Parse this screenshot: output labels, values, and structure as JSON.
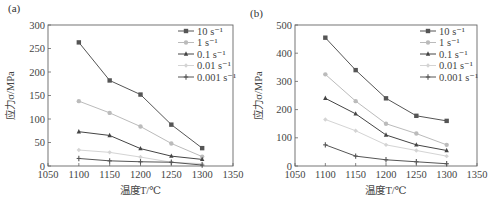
{
  "chart_data": [
    {
      "panel": "(a)",
      "type": "line",
      "title": "",
      "xlabel": "温度T/℃",
      "ylabel": "应力σ/MPa",
      "x": [
        1100,
        1150,
        1200,
        1250,
        1300
      ],
      "xlim": [
        1050,
        1350
      ],
      "ylim": [
        0,
        300
      ],
      "xticks": [
        1050,
        1100,
        1150,
        1200,
        1250,
        1300,
        1350
      ],
      "yticks": [
        0,
        50,
        100,
        150,
        200,
        250,
        300
      ],
      "grid": false,
      "legend_position": "upper right",
      "series": [
        {
          "name": "10 s⁻¹",
          "marker": "square",
          "color": "#555555",
          "values": [
            263,
            182,
            152,
            88,
            38
          ]
        },
        {
          "name": "1 s⁻¹",
          "marker": "circle",
          "color": "#bbbbbb",
          "values": [
            138,
            113,
            84,
            48,
            20
          ]
        },
        {
          "name": "0.1 s⁻¹",
          "marker": "triangle",
          "color": "#444444",
          "values": [
            73,
            65,
            37,
            21,
            14
          ]
        },
        {
          "name": "0.01 s⁻¹",
          "marker": "diamond",
          "color": "#d4d4d4",
          "values": [
            34,
            29,
            19,
            8,
            5
          ]
        },
        {
          "name": "0.001 s⁻¹",
          "marker": "star",
          "color": "#555555",
          "values": [
            16,
            11,
            9,
            8,
            2
          ]
        }
      ]
    },
    {
      "panel": "(b)",
      "type": "line",
      "title": "",
      "xlabel": "温度T/℃",
      "ylabel": "应力σ/MPa",
      "x": [
        1100,
        1150,
        1200,
        1250,
        1300
      ],
      "xlim": [
        1050,
        1350
      ],
      "ylim": [
        0,
        500
      ],
      "xticks": [
        1050,
        1100,
        1150,
        1200,
        1250,
        1300,
        1350
      ],
      "yticks": [
        0,
        100,
        200,
        300,
        400,
        500
      ],
      "grid": false,
      "legend_position": "upper right",
      "series": [
        {
          "name": "10 s⁻¹",
          "marker": "square",
          "color": "#555555",
          "values": [
            455,
            340,
            240,
            178,
            160
          ]
        },
        {
          "name": "1 s⁻¹",
          "marker": "circle",
          "color": "#bbbbbb",
          "values": [
            325,
            230,
            150,
            115,
            75
          ]
        },
        {
          "name": "0.1 s⁻¹",
          "marker": "triangle",
          "color": "#444444",
          "values": [
            240,
            185,
            110,
            75,
            55
          ]
        },
        {
          "name": "0.01 s⁻¹",
          "marker": "diamond",
          "color": "#d4d4d4",
          "values": [
            165,
            125,
            75,
            55,
            35
          ]
        },
        {
          "name": "0.001 s⁻¹",
          "marker": "star",
          "color": "#555555",
          "values": [
            75,
            35,
            22,
            15,
            8
          ]
        }
      ]
    }
  ],
  "labels": {
    "panel_a": "(a)",
    "panel_b": "(b)",
    "xlabel": "温度T/℃",
    "ylabel": "应力σ/MPa"
  }
}
